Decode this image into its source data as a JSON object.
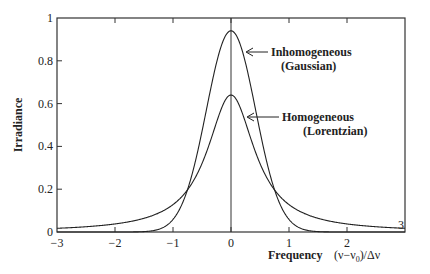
{
  "chart_data": {
    "type": "line",
    "title": "",
    "xlabel": "Frequency",
    "xlabel_units": "(ν−ν0)/Δν",
    "ylabel": "Irradiance",
    "xlim": [
      -3,
      3
    ],
    "ylim": [
      0,
      1
    ],
    "grid": false,
    "x_ticks": [
      -3,
      -2,
      -1,
      0,
      1,
      2,
      3
    ],
    "x_tick_labels": [
      "−3",
      "−2",
      "−1",
      "0",
      "1",
      "2",
      "3"
    ],
    "y_ticks": [
      0,
      0.2,
      0.4,
      0.6,
      0.8,
      1
    ],
    "y_tick_labels": [
      "0",
      "0.2",
      "0.4",
      "0.6",
      "0.8",
      "1"
    ],
    "series": [
      {
        "name": "Inhomogeneous (Gaussian)",
        "label_line1": "Inhomogeneous",
        "label_line2": "(Gaussian)",
        "peak": 0.94,
        "fwhm": 1,
        "x": [
          -3,
          -2,
          -1.5,
          -1,
          -0.75,
          -0.5,
          -0.25,
          0,
          0.25,
          0.5,
          0.75,
          1,
          1.5,
          2,
          3
        ],
        "values": [
          0.0,
          0.0,
          0.002,
          0.059,
          0.198,
          0.47,
          0.78,
          0.94,
          0.78,
          0.47,
          0.198,
          0.059,
          0.002,
          0.0,
          0.0
        ]
      },
      {
        "name": "Homogeneous (Lorentzian)",
        "label_line1": "Homogeneous",
        "label_line2": "(Lorentzian)",
        "peak": 0.64,
        "fwhm": 1,
        "x": [
          -3,
          -2,
          -1.5,
          -1,
          -0.75,
          -0.5,
          -0.25,
          0,
          0.25,
          0.5,
          0.75,
          1,
          1.5,
          2,
          3
        ],
        "values": [
          0.018,
          0.037,
          0.064,
          0.127,
          0.196,
          0.318,
          0.509,
          0.637,
          0.509,
          0.318,
          0.196,
          0.127,
          0.064,
          0.037,
          0.018
        ]
      }
    ],
    "annotations": [
      "Inhomogeneous (Gaussian)",
      "Homogeneous (Lorentzian)"
    ]
  },
  "labels": {
    "ylabel": "Irradiance",
    "xlabel": "Frequency",
    "xunits_open": "(ν−ν",
    "xunits_sub": "0",
    "xunits_close": ")/Δν",
    "gauss1": "Inhomogeneous",
    "gauss2": "(Gaussian)",
    "lor1": "Homogeneous",
    "lor2": "(Lorentzian)",
    "corner3": "3"
  }
}
